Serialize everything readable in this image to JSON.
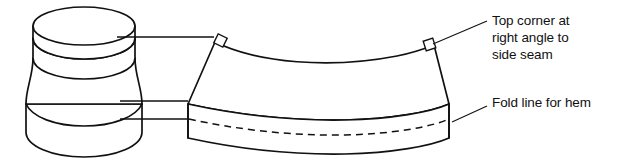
{
  "figure": {
    "background_color": "#ffffff",
    "line_color": "#111111"
  },
  "annotations": [
    {
      "id": "top-corner",
      "text": "Top corner at\nright angle to\nside seam",
      "lines": [
        "Top corner at",
        "right angle to",
        "side seam"
      ],
      "target": "top-right-corner-of-panel"
    },
    {
      "id": "fold-line",
      "text": "Fold line for hem",
      "lines": [
        "Fold line for hem"
      ],
      "target": "dashed-hem-fold-line"
    }
  ],
  "shapes": {
    "spool": {
      "name": "three-dimensional-spool-form",
      "description": "Waisted cylindrical form with elliptical top face, concave middle and flared lower skirt"
    },
    "panel": {
      "name": "flat-fabric-panel",
      "description": "Curved trapezoidal pattern piece with right-angle corner marks and a dashed hem fold line"
    }
  },
  "markers": {
    "right_angle_label": "right-angle-square",
    "count": 2
  },
  "leaders": {
    "spool_to_panel_count": 3,
    "callout_count": 2
  }
}
